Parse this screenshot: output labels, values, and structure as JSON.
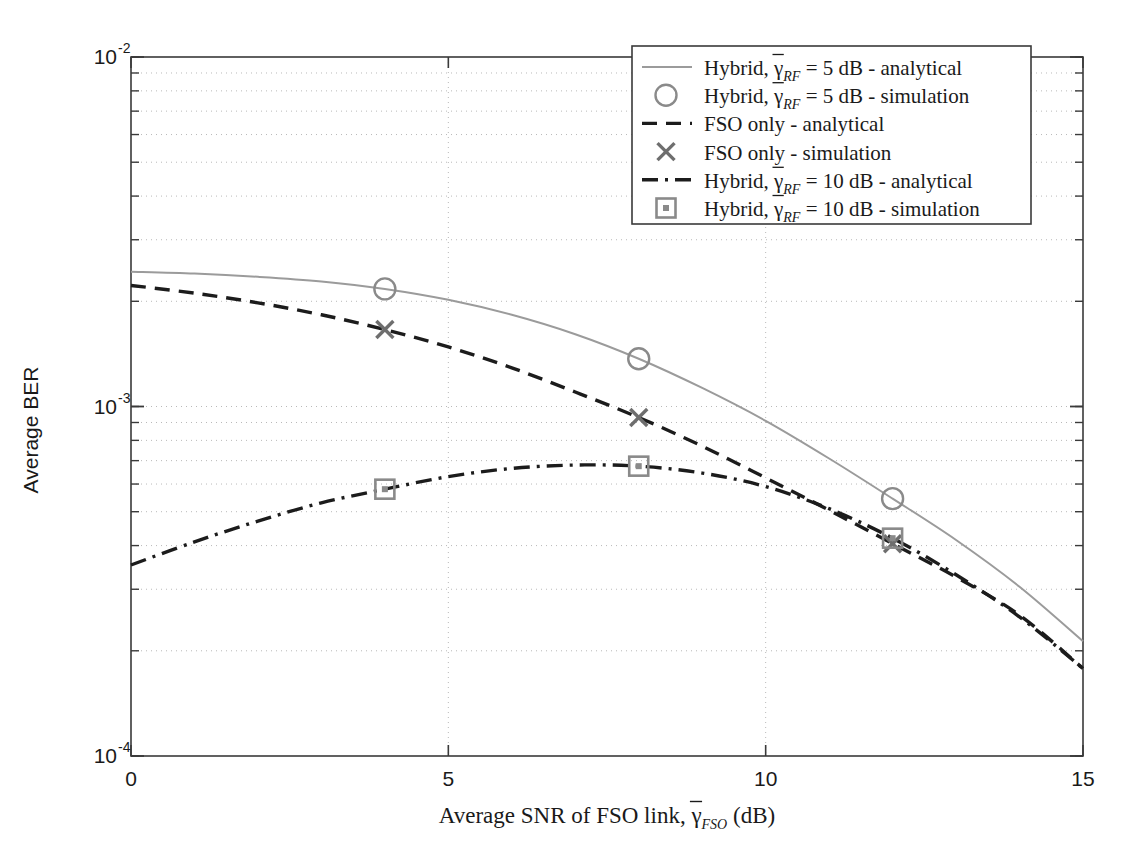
{
  "figure": {
    "background": "#ffffff",
    "axis_color": "#3a3a3a",
    "grid_color": "#b9b9b9"
  },
  "chart_data": {
    "type": "line",
    "title": "",
    "xlabel_parts": {
      "main": "Average SNR of FSO link, ",
      "gamma": "γ",
      "sub": "FSO",
      "tail": " (dB)"
    },
    "xlabel": "Average SNR of FSO link, γ̄_FSO (dB)",
    "ylabel": "Average BER",
    "xlim": [
      0,
      15
    ],
    "ylim": [
      0.0001,
      0.01
    ],
    "yscale": "log",
    "xticks": [
      0,
      5,
      10,
      15
    ],
    "xtick_labels": [
      "0",
      "5",
      "10",
      "15"
    ],
    "yticks": [
      0.0001,
      0.001,
      0.01
    ],
    "ytick_labels": [
      "10",
      "10",
      "10"
    ],
    "ytick_exponents": [
      "-4",
      "-3",
      "-2"
    ],
    "grid": true,
    "grid_style": "dotted-minor-and-major",
    "legend_position": "top-right",
    "series": [
      {
        "name": "hybrid-5db-analytical",
        "legend_label_parts": {
          "pre": "Hybrid, ",
          "gamma": "γ",
          "sub": "RF",
          "post": "= 5 dB - analytical"
        },
        "legend_label": "Hybrid, γ̄_RF = 5 dB - analytical",
        "style": "solid",
        "color": "#9b9b9b",
        "marker": "none",
        "x": [
          0,
          1,
          2,
          3,
          4,
          5,
          6,
          7,
          8,
          9,
          10,
          11,
          12,
          13,
          14,
          15
        ],
        "y": [
          0.00243,
          0.0024,
          0.00235,
          0.00228,
          0.00217,
          0.00202,
          0.00183,
          0.00161,
          0.00137,
          0.00113,
          0.00091,
          0.00071,
          0.000545,
          0.000415,
          0.000305,
          0.000213
        ]
      },
      {
        "name": "hybrid-5db-simulation",
        "legend_label_parts": {
          "pre": "Hybrid, ",
          "gamma": "γ",
          "sub": "RF",
          "post": "= 5 dB - simulation"
        },
        "legend_label": "Hybrid, γ̄_RF = 5 dB - simulation",
        "style": "markers",
        "color": "#8a8a8a",
        "marker": "circle",
        "x": [
          4,
          8,
          12
        ],
        "y": [
          0.00217,
          0.00137,
          0.000545
        ]
      },
      {
        "name": "fso-only-analytical",
        "legend_label_parts": {
          "pre": "FSO only",
          "gamma": "",
          "sub": "",
          "post": "- analytical"
        },
        "legend_label": "FSO only - analytical",
        "style": "dashed",
        "color": "#1c1c1c",
        "marker": "none",
        "x": [
          0,
          1,
          2,
          3,
          4,
          5,
          6,
          7,
          8,
          9,
          10,
          11,
          12,
          13,
          14,
          15
        ],
        "y": [
          0.00222,
          0.00211,
          0.00198,
          0.00183,
          0.00166,
          0.00148,
          0.00129,
          0.0011,
          0.00093,
          0.00077,
          0.000625,
          0.000505,
          0.000405,
          0.000325,
          0.000253,
          0.000178
        ]
      },
      {
        "name": "fso-only-simulation",
        "legend_label_parts": {
          "pre": "FSO only",
          "gamma": "",
          "sub": "",
          "post": "- simulation"
        },
        "legend_label": "FSO only - simulation",
        "style": "markers",
        "color": "#6e6e6e",
        "marker": "x",
        "x": [
          4,
          8,
          12
        ],
        "y": [
          0.00166,
          0.00093,
          0.000405
        ]
      },
      {
        "name": "hybrid-10db-analytical",
        "legend_label_parts": {
          "pre": "Hybrid, ",
          "gamma": "γ",
          "sub": "RF",
          "post": "= 10 dB - analytical"
        },
        "legend_label": "Hybrid, γ̄_RF = 10 dB - analytical",
        "style": "dashdot",
        "color": "#1c1c1c",
        "marker": "none",
        "x": [
          0,
          1,
          2,
          3,
          4,
          5,
          6,
          7,
          8,
          9,
          10,
          11,
          12,
          13,
          14,
          15
        ],
        "y": [
          0.000352,
          0.00041,
          0.00047,
          0.00053,
          0.00058,
          0.00063,
          0.000665,
          0.00068,
          0.000675,
          0.000645,
          0.00059,
          0.00051,
          0.00042,
          0.00033,
          0.00025,
          0.000178
        ]
      },
      {
        "name": "hybrid-10db-simulation",
        "legend_label_parts": {
          "pre": "Hybrid, ",
          "gamma": "γ",
          "sub": "RF",
          "post": "= 10 dB - simulation"
        },
        "legend_label": "Hybrid, γ̄_RF = 10 dB - simulation",
        "style": "markers",
        "color": "#8a8a8a",
        "marker": "square",
        "x": [
          4,
          8,
          12
        ],
        "y": [
          0.00058,
          0.000675,
          0.00042
        ]
      }
    ]
  }
}
